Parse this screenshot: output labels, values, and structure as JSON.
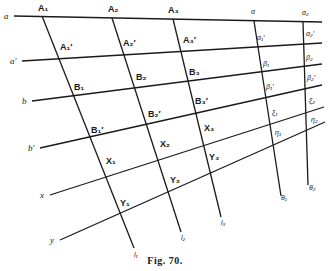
{
  "figure": {
    "caption": "Fig. 70.",
    "row_lines": [
      {
        "label": "a",
        "x1": 14,
        "y1": 16,
        "x2": 322,
        "y2": 22
      },
      {
        "label": "a′",
        "x1": 22,
        "y1": 61,
        "x2": 322,
        "y2": 43
      },
      {
        "label": "b",
        "x1": 32,
        "y1": 101,
        "x2": 322,
        "y2": 64
      },
      {
        "label": "b′",
        "x1": 40,
        "y1": 148,
        "x2": 322,
        "y2": 85
      },
      {
        "label": "x",
        "x1": 50,
        "y1": 195,
        "x2": 324,
        "y2": 107
      },
      {
        "label": "y",
        "x1": 60,
        "y1": 240,
        "x2": 325,
        "y2": 122
      }
    ],
    "column_lines": [
      {
        "label": "l₁",
        "x1": 42,
        "y1": 16,
        "x2": 134,
        "y2": 248
      },
      {
        "label": "l₂",
        "x1": 112,
        "y1": 18,
        "x2": 181,
        "y2": 232
      },
      {
        "label": "l₃",
        "x1": 173,
        "y1": 19,
        "x2": 221,
        "y2": 217
      },
      {
        "label": "θ₁",
        "x1": 254,
        "y1": 21,
        "x2": 281,
        "y2": 196
      },
      {
        "label": "θ₂",
        "x1": 303,
        "y1": 22,
        "x2": 308,
        "y2": 185
      }
    ],
    "row_labels": [
      {
        "text": "a",
        "x": 4,
        "y": 19
      },
      {
        "text": "a′",
        "x": 10,
        "y": 64
      },
      {
        "text": "b",
        "x": 22,
        "y": 104
      },
      {
        "text": "b′",
        "x": 28,
        "y": 151
      },
      {
        "text": "x",
        "x": 40,
        "y": 198
      },
      {
        "text": "y",
        "x": 50,
        "y": 243
      }
    ],
    "point_labels": [
      {
        "text": "A₁",
        "x": 38,
        "y": 11
      },
      {
        "text": "A₂",
        "x": 108,
        "y": 12
      },
      {
        "text": "A₃",
        "x": 168,
        "y": 13
      },
      {
        "text": "A₁′",
        "x": 60,
        "y": 50
      },
      {
        "text": "A₂′",
        "x": 123,
        "y": 46
      },
      {
        "text": "A₃′",
        "x": 183,
        "y": 43
      },
      {
        "text": "B₁",
        "x": 74,
        "y": 90
      },
      {
        "text": "B₂",
        "x": 136,
        "y": 80
      },
      {
        "text": "B₃",
        "x": 189,
        "y": 75
      },
      {
        "text": "B₁′",
        "x": 91,
        "y": 133
      },
      {
        "text": "B₂′",
        "x": 148,
        "y": 117
      },
      {
        "text": "B₃′",
        "x": 195,
        "y": 104
      },
      {
        "text": "X₁",
        "x": 106,
        "y": 164
      },
      {
        "text": "X₂",
        "x": 160,
        "y": 147
      },
      {
        "text": "X₃",
        "x": 204,
        "y": 131
      },
      {
        "text": "Y₁",
        "x": 120,
        "y": 206
      },
      {
        "text": "Y₂",
        "x": 170,
        "y": 183
      },
      {
        "text": "Y₃",
        "x": 209,
        "y": 160
      }
    ],
    "greek_labels": [
      {
        "text": "α",
        "x": 251,
        "y": 14
      },
      {
        "text": "α₂",
        "x": 302,
        "y": 15
      },
      {
        "text": "α₁′",
        "x": 257,
        "y": 40
      },
      {
        "text": "α₂′",
        "x": 306,
        "y": 36
      },
      {
        "text": "β₁",
        "x": 263,
        "y": 66
      },
      {
        "text": "β₂",
        "x": 306,
        "y": 60
      },
      {
        "text": "β₁′",
        "x": 266,
        "y": 89
      },
      {
        "text": "β₂′",
        "x": 307,
        "y": 80
      },
      {
        "text": "ξ₁",
        "x": 272,
        "y": 115
      },
      {
        "text": "ξ₂",
        "x": 309,
        "y": 103
      },
      {
        "text": "η₁",
        "x": 275,
        "y": 135
      },
      {
        "text": "η₂",
        "x": 311,
        "y": 122
      }
    ],
    "end_labels": [
      {
        "text": "l₁",
        "x": 134,
        "y": 257
      },
      {
        "text": "l₂",
        "x": 181,
        "y": 240
      },
      {
        "text": "l₃",
        "x": 221,
        "y": 225
      },
      {
        "text": "θ₁",
        "x": 281,
        "y": 200
      },
      {
        "text": "θ₂",
        "x": 309,
        "y": 190
      }
    ]
  }
}
